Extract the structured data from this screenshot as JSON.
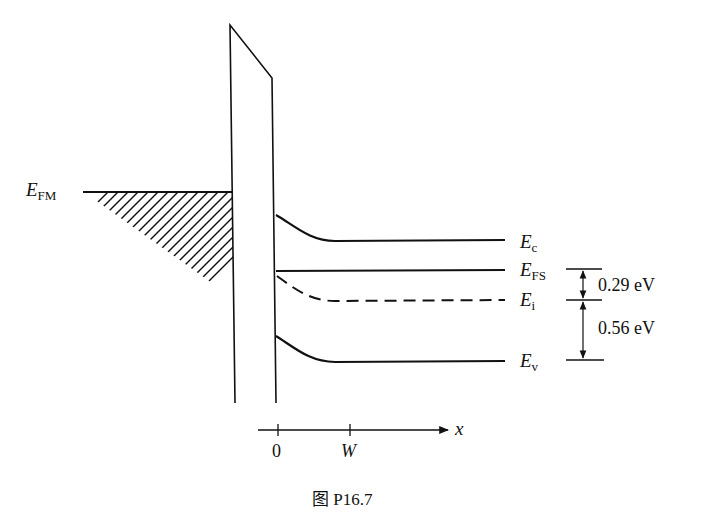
{
  "figure": {
    "caption": "图 P16.7",
    "labels": {
      "efm": {
        "main": "E",
        "sub": "FM"
      },
      "ec": {
        "main": "E",
        "sub": "c"
      },
      "efs": {
        "main": "E",
        "sub": "FS"
      },
      "ei": {
        "main": "E",
        "sub": "i"
      },
      "ev": {
        "main": "E",
        "sub": "v"
      }
    },
    "energy_gaps": {
      "efs_to_ei": "0.29 eV",
      "ei_to_ev": "0.56 eV"
    },
    "x_axis": {
      "label": "x",
      "ticks": [
        "0",
        "W"
      ]
    }
  }
}
